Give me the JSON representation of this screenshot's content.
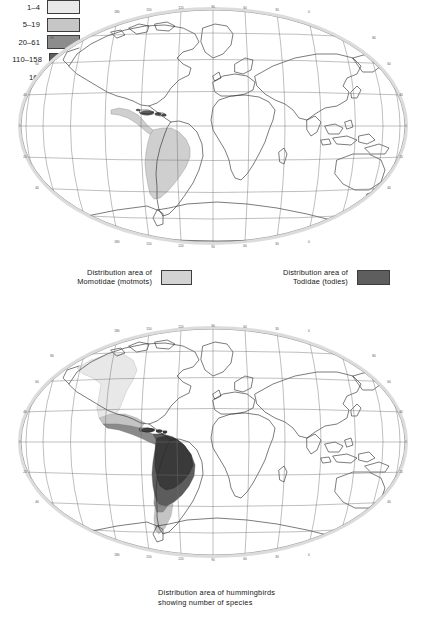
{
  "figure": {
    "type": "two-panel world distribution map",
    "projection": "oval (Winkel-tripel style) world graticule"
  },
  "maps": {
    "top": {
      "name": "motmot-and-tody-distribution-map",
      "graticule": {
        "lon_labels": [
          "180",
          "150",
          "120",
          "90",
          "60",
          "30",
          "0",
          "30",
          "60",
          "90",
          "120",
          "150",
          "180"
        ],
        "lat_labels": [
          "80",
          "60",
          "40",
          "20",
          "0",
          "20",
          "40",
          "60",
          "80"
        ]
      },
      "regions": [
        {
          "name": "Momotidae range (Mexico, Central America, South America)",
          "shade": "#cfcfcf"
        },
        {
          "name": "Todidae range (Greater Antilles)",
          "shade": "#5a5a5a"
        }
      ]
    },
    "bottom": {
      "name": "hummingbird-species-richness-map",
      "graticule": {
        "lon_labels": [
          "180",
          "150",
          "120",
          "90",
          "60",
          "30",
          "0",
          "30",
          "60",
          "90",
          "120",
          "150",
          "180"
        ],
        "lat_labels": [
          "80",
          "60",
          "40",
          "20",
          "0",
          "20",
          "40",
          "60",
          "80"
        ]
      },
      "regions": [
        {
          "name": "1-4 species (northern/western North America)",
          "shade": "#e8e8e8"
        },
        {
          "name": "5-19 species (southern USA, southern South America)",
          "shade": "#c4c4c4"
        },
        {
          "name": "20-61 species (Mexico, Caribbean, Patagonia)",
          "shade": "#8a8a8a"
        },
        {
          "name": "110-158 species (Central America, eastern South America)",
          "shade": "#5c5c5c"
        },
        {
          "name": "163 species (Andes, Amazonia core)",
          "shade": "#3a3a3a"
        }
      ]
    }
  },
  "legends": {
    "momotidae": {
      "text": "Distribution area of\nMomotidae (motmots)",
      "swatch_color": "#d3d3d3"
    },
    "todidae": {
      "text": "Distribution area of\nTodidae (todies)",
      "swatch_color": "#5e5e5e"
    },
    "hummingbird_caption": "Distribution area of hummingbirds\nshowing number of species",
    "scale_left": [
      {
        "label": "1–4",
        "swatch_color": "#e9e9e9"
      },
      {
        "label": "5–19",
        "swatch_color": "#c6c6c6"
      },
      {
        "label": "20–61",
        "swatch_color": "#8c8c8c"
      }
    ],
    "scale_right": [
      {
        "label": "110–158",
        "swatch_color": "#5d5d5d"
      },
      {
        "label": "163",
        "swatch_color": "#3b3b3b"
      }
    ]
  },
  "colors": {
    "coastline": "#2b2b2b",
    "graticule": "#6f6f6f",
    "frame_halo": "#d9d9d9",
    "text": "#161616",
    "background": "#ffffff"
  }
}
